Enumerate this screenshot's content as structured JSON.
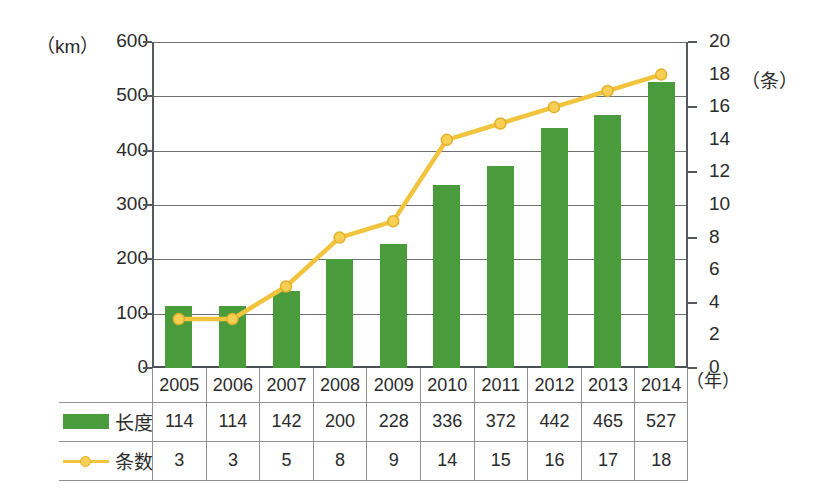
{
  "chart_data": {
    "type": "bar",
    "title": "",
    "subtitle": "",
    "xlabel": "（年）",
    "ylabel": "（km）",
    "y2label": "（条）",
    "grid": true,
    "legend_position": "bottom-table",
    "categories": [
      "2005",
      "2006",
      "2007",
      "2008",
      "2009",
      "2010",
      "2011",
      "2012",
      "2013",
      "2014"
    ],
    "ylim": [
      0,
      600
    ],
    "y2lim": [
      0,
      20
    ],
    "yticks": [
      0,
      100,
      200,
      300,
      400,
      500,
      600
    ],
    "y2ticks": [
      0,
      2,
      4,
      6,
      8,
      10,
      12,
      14,
      16,
      18,
      20
    ],
    "series": [
      {
        "name": "长度",
        "type": "bar",
        "axis": "left",
        "unit": "km",
        "color": "#4a9b3c",
        "values": [
          114,
          114,
          142,
          200,
          228,
          336,
          372,
          442,
          465,
          527
        ]
      },
      {
        "name": "条数",
        "type": "line",
        "axis": "right",
        "unit": "条",
        "color": "#f2c33d",
        "values": [
          3,
          3,
          5,
          8,
          9,
          14,
          15,
          16,
          17,
          18
        ]
      }
    ]
  },
  "axes": {
    "left_unit": "（km）",
    "right_unit": "（条）",
    "x_unit": "（年）",
    "left_ticks": [
      "600",
      "500",
      "400",
      "300",
      "200",
      "100",
      "0"
    ],
    "right_ticks": [
      "20",
      "18",
      "16",
      "14",
      "12",
      "10",
      "8",
      "6",
      "4",
      "2",
      "0"
    ]
  },
  "table": {
    "years": [
      "2005",
      "2006",
      "2007",
      "2008",
      "2009",
      "2010",
      "2011",
      "2012",
      "2013",
      "2014"
    ],
    "rows": [
      {
        "label": "长度",
        "marker": "bar-swatch",
        "values": [
          "114",
          "114",
          "142",
          "200",
          "228",
          "336",
          "372",
          "442",
          "465",
          "527"
        ]
      },
      {
        "label": "条数",
        "marker": "line-swatch",
        "values": [
          "3",
          "3",
          "5",
          "8",
          "9",
          "14",
          "15",
          "16",
          "17",
          "18"
        ]
      }
    ]
  },
  "colors": {
    "bar": "#4a9b3c",
    "line": "#f2c33d",
    "marker_fill": "#f7cf55",
    "grid": "#6b7075",
    "axis": "#4a4f53",
    "text": "#2b2b2b",
    "background": "#ffffff"
  }
}
